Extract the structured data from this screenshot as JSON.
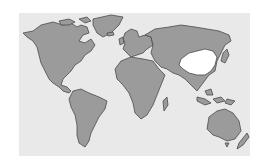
{
  "map": {
    "type": "world-map",
    "projection": "equirectangular",
    "colors": {
      "background": "#ffffff",
      "ocean": "#e9e9e9",
      "land": "#9b9b9b",
      "outline": "#4a4a4a",
      "highlight": "#ffffff"
    },
    "highlighted_regions": [
      "China"
    ],
    "continents": [
      "North America",
      "Greenland",
      "South America",
      "Europe",
      "Africa",
      "Asia",
      "Australia",
      "New Zealand",
      "Madagascar",
      "Japan",
      "Indonesia"
    ]
  }
}
